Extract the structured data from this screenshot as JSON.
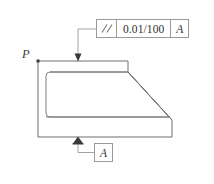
{
  "drawing": {
    "type": "engineering-gdt-drawing",
    "background_color": "#ffffff",
    "line_color": "#6f6f6f",
    "text_color": "#2f2f2f",
    "labels": {
      "surface_point": "P"
    },
    "feature_control_frame": {
      "symbol_name": "parallelism-symbol",
      "symbol_text": "//",
      "tolerance": "0.01/100",
      "datum_reference": "A"
    },
    "datum_feature": {
      "label": "A",
      "indicator": "filled-triangle"
    },
    "leaders": [
      {
        "name": "fcf-leader",
        "from": "feature-control-frame",
        "to": "top-surface",
        "arrow": "down-arrowhead"
      },
      {
        "name": "datum-leader",
        "from": "datum-label-box",
        "to": "bottom-surface",
        "arrow": "filled-triangle"
      }
    ],
    "part_outline": {
      "name": "bracket-profile",
      "outer_path": "M38,61 L128,61 L128,72 L172,120 L172,137 L38,137 Z",
      "inner_path": "rounded-rect 50,72 to 128,115 with sloped right edge"
    }
  }
}
